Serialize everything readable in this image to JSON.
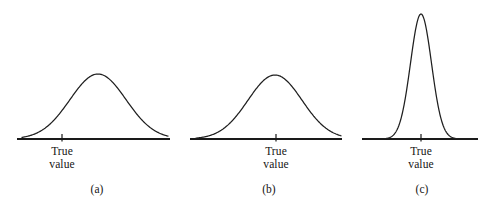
{
  "figure": {
    "background_color": "#ffffff",
    "ink_color": "#1a1a1a",
    "width": 492,
    "height": 206,
    "axis_y": 139
  },
  "chart_data": {
    "type": "line",
    "title": "",
    "subtitle": "",
    "xlabel": "",
    "ylabel": "",
    "grid": false,
    "legend": null,
    "panels": [
      {
        "caption": "(a)",
        "caption_x": 97,
        "caption_y": 190,
        "axis_x_start": 17,
        "axis_x_end": 170,
        "tick_x": 62,
        "tick_label_lines": [
          "True",
          "value"
        ],
        "curve": {
          "shape": "gaussian",
          "mean_x": 98,
          "sigma_x": 28,
          "peak_height": 65,
          "x_start": 22,
          "x_end": 168
        },
        "true_value_x": 62,
        "bias": "biased-high",
        "spread": "large"
      },
      {
        "caption": "(b)",
        "caption_x": 269,
        "caption_y": 190,
        "axis_x_start": 190,
        "axis_x_end": 342,
        "tick_x": 276,
        "tick_label_lines": [
          "True",
          "value"
        ],
        "curve": {
          "shape": "gaussian",
          "mean_x": 275,
          "sigma_x": 27,
          "peak_height": 64,
          "x_start": 196,
          "x_end": 341
        },
        "true_value_x": 276,
        "bias": "unbiased",
        "spread": "large"
      },
      {
        "caption": "(c)",
        "caption_x": 422,
        "caption_y": 190,
        "axis_x_start": 362,
        "axis_x_end": 478,
        "tick_x": 421,
        "tick_label_lines": [
          "True",
          "value"
        ],
        "curve": {
          "shape": "gaussian",
          "mean_x": 421,
          "sigma_x": 10.5,
          "peak_height": 125,
          "x_start": 367,
          "x_end": 474
        },
        "true_value_x": 421,
        "bias": "unbiased",
        "spread": "small"
      }
    ]
  }
}
